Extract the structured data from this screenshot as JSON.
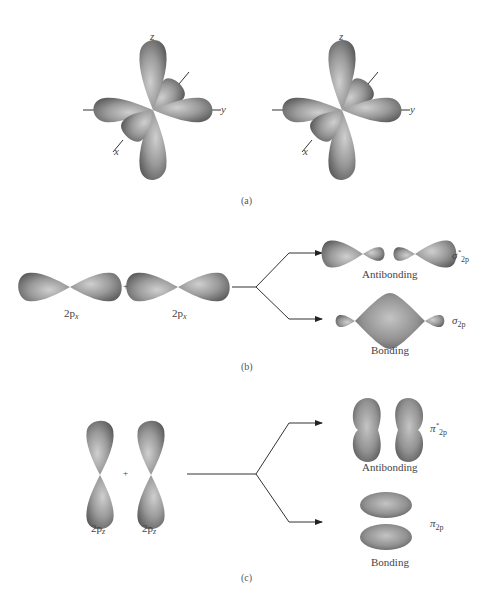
{
  "panel_a": {
    "caption": "(a)",
    "axes": {
      "x": "x",
      "y": "y",
      "z": "z"
    }
  },
  "panel_b": {
    "caption": "(b)",
    "reactant_left": {
      "base": "2p",
      "sub": "x"
    },
    "reactant_right": {
      "base": "2p",
      "sub": "x"
    },
    "plus": "+",
    "antibonding_label": "Antibonding",
    "bonding_label": "Bonding",
    "antibonding_symbol": {
      "greek": "σ",
      "sup": "*",
      "sub": "2p"
    },
    "bonding_symbol": {
      "greek": "σ",
      "sub": "2p"
    }
  },
  "panel_c": {
    "caption": "(c)",
    "reactant_left": {
      "base": "2p",
      "sub": "z"
    },
    "reactant_right": {
      "base": "2p",
      "sub": "z"
    },
    "plus": "+",
    "antibonding_label": "Antibonding",
    "bonding_label": "Bonding",
    "antibonding_symbol": {
      "greek": "π",
      "sup": "*",
      "sub": "2p"
    },
    "bonding_symbol": {
      "greek": "π",
      "sub": "2p"
    }
  }
}
